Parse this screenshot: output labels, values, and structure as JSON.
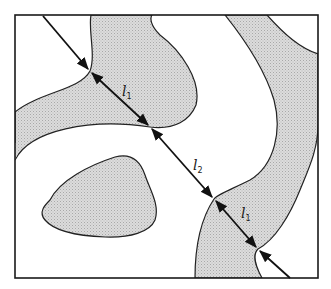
{
  "diagram": {
    "colors": {
      "background": "#ffffff",
      "phase_fill": "#d6d6d6",
      "outline": "#222222",
      "frame": "#1a1a1a"
    },
    "labels": [
      {
        "id": "l1_top",
        "text": "l",
        "subscript": "1"
      },
      {
        "id": "l2_middle",
        "text": "l",
        "subscript": "2"
      },
      {
        "id": "l1_bottom",
        "text": "l",
        "subscript": "1"
      }
    ],
    "test_line": {
      "start": [
        43,
        16
      ],
      "end": [
        290,
        278
      ],
      "intercepts": [
        [
          90,
          71
        ],
        [
          150,
          127
        ],
        [
          214,
          199
        ],
        [
          258,
          249
        ]
      ]
    }
  }
}
